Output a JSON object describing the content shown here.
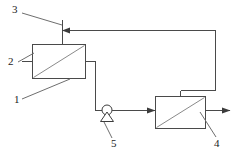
{
  "diagram": {
    "background_color": "#ffffff",
    "line_color": "#4a4a4a",
    "hatch_color": "#8a8a8a",
    "label_color": "#1a1a1a",
    "width": 238,
    "height": 163,
    "reference_labels": [
      {
        "id": "label-3",
        "text": "3",
        "x": 12,
        "y": 9,
        "describes": "feed-inlet-line"
      },
      {
        "id": "label-2",
        "text": "2",
        "x": 8,
        "y": 60,
        "describes": "first-membrane-module"
      },
      {
        "id": "label-1",
        "text": "1",
        "x": 13,
        "y": 99,
        "describes": "first-module-lower-port"
      },
      {
        "id": "label-5",
        "text": "5",
        "x": 114,
        "y": 141,
        "describes": "circulation-pump"
      },
      {
        "id": "label-4",
        "text": "4",
        "x": 215,
        "y": 141,
        "describes": "permeate-outlet-line"
      }
    ],
    "components": [
      {
        "id": "first-membrane-module",
        "name": "membrane-module-left",
        "x": 32,
        "y": 44,
        "width": 53,
        "height": 34
      },
      {
        "id": "second-membrane-module",
        "name": "membrane-module-right",
        "x": 155,
        "y": 96,
        "width": 50,
        "height": 32
      },
      {
        "id": "circulation-pump",
        "name": "pump",
        "cx": 107,
        "cy": 110,
        "r": 5
      }
    ],
    "flow_lines": [
      {
        "id": "feed-inlet",
        "name": "feed-inlet-horizontal",
        "direction": "left"
      },
      {
        "id": "module-top-riser",
        "name": "left-module-top-riser"
      },
      {
        "id": "top-return",
        "name": "top-return-header"
      },
      {
        "id": "right-downcomer",
        "name": "right-side-downcomer"
      },
      {
        "id": "right-module-feed",
        "name": "right-module-top-feed"
      },
      {
        "id": "left-module-outlet",
        "name": "left-module-right-outlet"
      },
      {
        "id": "pump-suction",
        "name": "pump-suction-drop"
      },
      {
        "id": "pump-discharge",
        "name": "pump-discharge-to-right-module",
        "direction": "right"
      },
      {
        "id": "permeate-outlet",
        "name": "permeate-outlet",
        "direction": "right"
      },
      {
        "id": "left-module-side-port",
        "name": "left-module-left-port"
      }
    ]
  }
}
